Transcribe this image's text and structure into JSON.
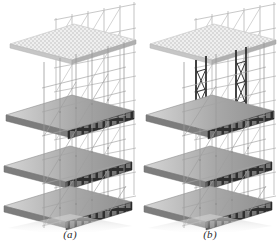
{
  "figure": {
    "type": "technical-illustration",
    "rendering": "grayscale 3D axonometric line-and-shade drawing",
    "background_color": "#ffffff",
    "panel_count": 2
  },
  "panels": [
    {
      "id": "a",
      "caption": "(a)",
      "description": "Scaffold tower grid with four slab levels; uniform light-gray standards and ledgers",
      "slabs": [
        {
          "level": 4,
          "style": "mesh",
          "label": "top formwork deck (stippled/perforated)",
          "y": 24,
          "fill": "#dcdcdc"
        },
        {
          "level": 3,
          "style": "solid",
          "label": "upper concrete slab",
          "y": 95,
          "fill": "#9a9a9a"
        },
        {
          "level": 2,
          "style": "solid",
          "label": "middle concrete slab",
          "y": 150,
          "fill": "#9a9a9a"
        },
        {
          "level": 1,
          "style": "solid",
          "label": "lower concrete slab",
          "y": 200,
          "fill": "#9a9a9a"
        }
      ],
      "shore_style": "light",
      "shore_color": "#a9a9a9",
      "bay_columns": 5,
      "bay_rows": 9
    },
    {
      "id": "b",
      "caption": "(b)",
      "description": "Same scaffold grid with two heavy dark shore towers highlighted at the upper levels",
      "slabs": [
        {
          "level": 4,
          "style": "mesh",
          "label": "top formwork deck (stippled/perforated)",
          "y": 24,
          "fill": "#dcdcdc"
        },
        {
          "level": 3,
          "style": "solid",
          "label": "upper concrete slab",
          "y": 95,
          "fill": "#9a9a9a"
        },
        {
          "level": 2,
          "style": "solid",
          "label": "middle concrete slab",
          "y": 150,
          "fill": "#9a9a9a"
        },
        {
          "level": 1,
          "style": "solid",
          "label": "lower concrete slab",
          "y": 200,
          "fill": "#9a9a9a"
        }
      ],
      "shore_style": "heavy-dark",
      "shore_color": "#2f2f2f",
      "bay_columns": 5,
      "bay_rows": 9
    }
  ],
  "colors": {
    "background": "#ffffff",
    "slab_top": "#b4b4b4",
    "slab_front_dark": "#2b2b2b",
    "slab_side": "#8c8c8c",
    "mesh_deck": "#dcdcdc",
    "frame_light": "#a0a0a0",
    "frame_mid": "#707070",
    "frame_dark": "#303030",
    "caption_text": "#2b2b2b"
  },
  "captions": {
    "a": "(a)",
    "b": "(b)"
  }
}
